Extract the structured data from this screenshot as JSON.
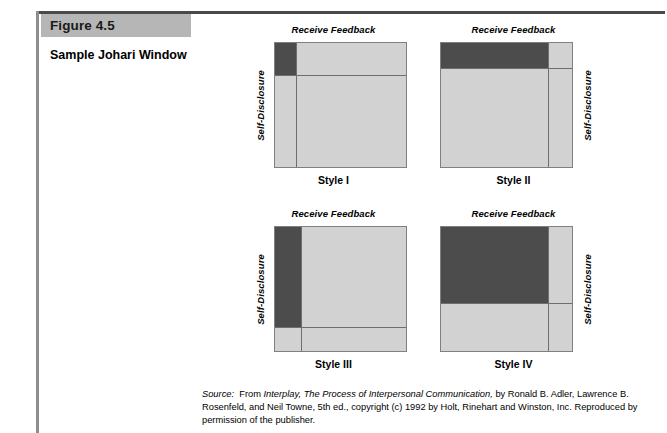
{
  "figure": {
    "tag": "Figure 4.5",
    "title": "Sample Johari Window"
  },
  "axis_labels": {
    "horizontal": "Receive Feedback",
    "vertical": "Self-Disclosure"
  },
  "windows": [
    {
      "caption": "Style I",
      "label_side": "left",
      "dark_width_pct": 16,
      "dark_height_pct": 26,
      "divider_x_pct": 16,
      "divider_y_pct": 26
    },
    {
      "caption": "Style II",
      "label_side": "right",
      "dark_width_pct": 82,
      "dark_height_pct": 20,
      "divider_x_pct": 82,
      "divider_y_pct": 20
    },
    {
      "caption": "Style III",
      "label_side": "left",
      "dark_width_pct": 20,
      "dark_height_pct": 81,
      "divider_x_pct": 20,
      "divider_y_pct": 81
    },
    {
      "caption": "Style IV",
      "label_side": "right",
      "dark_width_pct": 82,
      "dark_height_pct": 61,
      "divider_x_pct": 82,
      "divider_y_pct": 61
    }
  ],
  "source": {
    "label": "Source:",
    "intro": "From",
    "title": "Interplay, The Process of Interpersonal Communication,",
    "rest": "by Ronald B. Adler, Lawrence B. Rosenfeld, and Neil Towne, 5th ed., copyright (c) 1992 by Holt, Rinehart and Winston, Inc. Reproduced by permission of the publisher."
  },
  "colors": {
    "dark_quadrant": "#4c4c4c",
    "light_quadrant": "#d2d2d2",
    "tag_background": "#b6b6b6",
    "rule": "#4a4a4a"
  }
}
